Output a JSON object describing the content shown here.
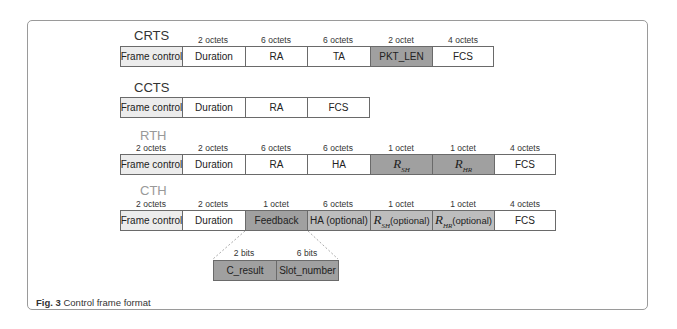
{
  "figure": {
    "caption_label": "Fig. 3",
    "caption_text": " Control frame format"
  },
  "frames": {
    "crts": {
      "title": "CRTS",
      "sizes": [
        "",
        "2 octets",
        "6 octets",
        "6 octets",
        "2 octet",
        "4 octets"
      ],
      "fields": [
        "Frame control",
        "Duration",
        "RA",
        "TA",
        "PKT_LEN",
        "FCS"
      ]
    },
    "ccts": {
      "title": "CCTS",
      "fields": [
        "Frame control",
        "Duration",
        "RA",
        "FCS"
      ]
    },
    "rth": {
      "title": "RTH",
      "sizes": [
        "2 octets",
        "2 octets",
        "6 octets",
        "6 octets",
        "1 octet",
        "1 octet",
        "4 octets"
      ],
      "fields": [
        "Frame control",
        "Duration",
        "RA",
        "HA",
        "R",
        "R",
        "FCS"
      ],
      "subscripts": {
        "r_sh": "SH",
        "r_hr": "HR"
      }
    },
    "cth": {
      "title": "CTH",
      "sizes": [
        "2 octets",
        "2 octets",
        "1 octet",
        "6 octets",
        "1 octet",
        "1 octet",
        "4 octets"
      ],
      "fields": [
        "Frame control",
        "Duration",
        "Feedback",
        "HA (optional)",
        " (optional)",
        " (optional)",
        "FCS"
      ],
      "symbols": {
        "r": "R",
        "sub_sh": "SH",
        "sub_hr": "HR"
      }
    },
    "feedback": {
      "sizes": [
        "2 bits",
        "6 bits"
      ],
      "fields": [
        "C_result",
        "Slot_number"
      ]
    }
  }
}
